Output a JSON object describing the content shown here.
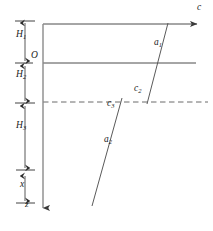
{
  "figure": {
    "type": "technical-line-diagram",
    "background_color": "#ffffff",
    "line_color": "#4d4d4d",
    "dashed_line_color": "#6b6b6b",
    "label_color": "#1a1a1a",
    "width": 213,
    "height": 231
  },
  "axes": {
    "horizontal": {
      "name": "c",
      "label": "c",
      "direction": "right",
      "arrow": true,
      "y": 24,
      "x_start": 43,
      "x_end": 200
    },
    "vertical": {
      "name": "z",
      "label": "z",
      "direction": "down",
      "arrow": true,
      "x": 43,
      "y_start": 24,
      "y_end": 212
    },
    "origin": {
      "label": "O",
      "x": 43,
      "y": 63
    }
  },
  "lines": [
    {
      "name": "top-boundary-line",
      "style": "solid",
      "x1": 43,
      "y1": 24,
      "x2": 200,
      "y2": 24
    },
    {
      "name": "origin-horizontal-line",
      "style": "solid",
      "x1": 43,
      "y1": 63,
      "x2": 196,
      "y2": 63
    },
    {
      "name": "interface-dashed-line",
      "style": "dashed",
      "x1": 43,
      "y1": 102,
      "x2": 208,
      "y2": 102
    },
    {
      "name": "slanted-line-a1",
      "style": "solid",
      "x1": 168,
      "y1": 23,
      "x2": 147,
      "y2": 104
    },
    {
      "name": "slanted-line-a2",
      "style": "solid",
      "x1": 122,
      "y1": 98,
      "x2": 92,
      "y2": 206
    }
  ],
  "dimension_markers": [
    {
      "name": "H1",
      "label": "H",
      "subscript": "1",
      "y_top": 22,
      "y_bottom": 62,
      "x": 25,
      "label_y": 35
    },
    {
      "name": "H2",
      "label": "H",
      "subscript": "2",
      "y_top": 64,
      "y_bottom": 102,
      "x": 25,
      "label_y": 76
    },
    {
      "name": "H3",
      "label": "H",
      "subscript": "3",
      "y_top": 104,
      "y_bottom": 164,
      "x": 25,
      "label_y": 127
    },
    {
      "name": "x",
      "label": "x",
      "subscript": "",
      "y_top": 177,
      "y_bottom": 203,
      "x": 25,
      "label_y": 184
    }
  ],
  "point_labels": [
    {
      "name": "label-c-axis",
      "label": "c",
      "subscript": "",
      "x": 199,
      "y": 9
    },
    {
      "name": "label-a1",
      "label": "a",
      "subscript": "1",
      "x": 155,
      "y": 44
    },
    {
      "name": "label-c2",
      "label": "c",
      "subscript": "2",
      "x": 135,
      "y": 89
    },
    {
      "name": "label-c3",
      "label": "c",
      "subscript": "3",
      "x": 108,
      "y": 104
    },
    {
      "name": "label-a2",
      "label": "a",
      "subscript": "2",
      "x": 105,
      "y": 141
    },
    {
      "name": "label-origin",
      "label": "O",
      "subscript": "",
      "x": 32,
      "y": 56
    },
    {
      "name": "label-z-axis",
      "label": "z",
      "subscript": "",
      "x": 27,
      "y": 205
    },
    {
      "name": "label-H1",
      "label": "H",
      "subscript": "1",
      "x": 18,
      "y": 36
    },
    {
      "name": "label-H2",
      "label": "H",
      "subscript": "2",
      "x": 18,
      "y": 76
    },
    {
      "name": "label-H3",
      "label": "H",
      "subscript": "3",
      "x": 18,
      "y": 127
    },
    {
      "name": "label-x",
      "label": "x",
      "subscript": "",
      "x": 21,
      "y": 185
    }
  ]
}
